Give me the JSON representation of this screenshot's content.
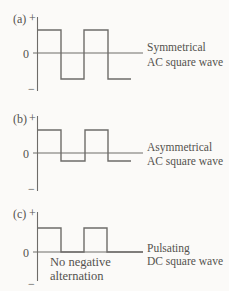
{
  "figure": {
    "colors": {
      "background": "#fbfaf8",
      "line": "#6e6c69",
      "text": "#54524e"
    },
    "panels": [
      {
        "index": "(a)",
        "plus": "+",
        "zero": "0",
        "minus": "−",
        "caption": [
          "Symmetrical",
          "AC square wave"
        ],
        "wave_points": "37,30 61,30 61,79 84,79 84,30 108,30 108,79 131,79",
        "signal": {
          "type": "square-wave",
          "polarity": "symmetrical AC",
          "alternations": "equal positive and negative"
        }
      },
      {
        "index": "(b)",
        "plus": "+",
        "zero": "0",
        "minus": "−",
        "caption": [
          "Asymmetrical",
          "AC square wave"
        ],
        "wave_points": "37,130 61,130 61,161 85,161 85,130 108,130 108,161 131,161",
        "signal": {
          "type": "square-wave",
          "polarity": "asymmetrical AC",
          "alternations": "large positive, small negative"
        }
      },
      {
        "index": "(c)",
        "plus": "+",
        "zero": "0",
        "minus": "−",
        "caption": [
          "Pulsating",
          "DC square wave"
        ],
        "note": [
          "No negative",
          "alternation"
        ],
        "wave_points": "37,228 61,228 61,252 84,252 84,228 107,228 107,252 143,252",
        "signal": {
          "type": "square-wave",
          "polarity": "pulsating DC",
          "alternations": "positive only, no negative alternation"
        }
      }
    ]
  }
}
